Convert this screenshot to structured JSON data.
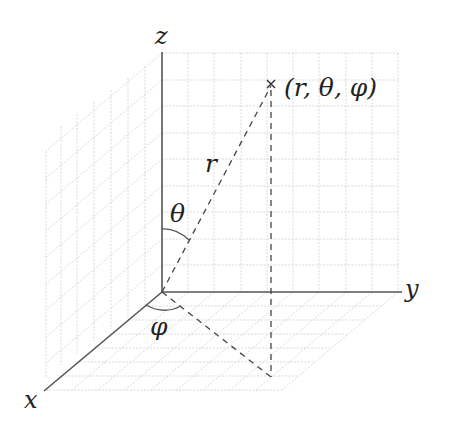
{
  "diagram": {
    "axes": {
      "x": "x",
      "y": "y",
      "z": "z"
    },
    "point_label": "(r, θ, φ)",
    "radius_label": "r",
    "polar_angle_label": "θ",
    "azimuth_label": "φ"
  },
  "colors": {
    "axis": "#555555",
    "grid": "#c8c8c8",
    "dashed": "#444444",
    "text": "#222222"
  }
}
